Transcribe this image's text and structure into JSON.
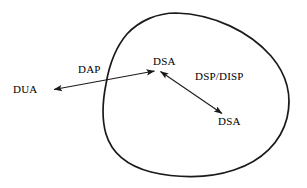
{
  "diagram": {
    "type": "x500-directory-architecture",
    "stroke_color": "#1a1a1a",
    "background_color": "#ffffff",
    "boundary": {
      "name": "directory-boundary-blob",
      "description": "closed freeform curve enclosing the directory"
    },
    "nodes": [
      {
        "id": "dua",
        "label": "DUA",
        "x": 13,
        "y": 83,
        "inside_boundary": false
      },
      {
        "id": "dsa-top",
        "label": "DSA",
        "x": 153,
        "y": 55,
        "inside_boundary": true
      },
      {
        "id": "dsa-bot",
        "label": "DSA",
        "x": 218,
        "y": 115,
        "inside_boundary": true
      }
    ],
    "edges": [
      {
        "id": "dap-edge",
        "label": "DAP",
        "label_x": 78,
        "label_y": 63,
        "from": "dua",
        "to": "dsa-top",
        "arrowheads": "both",
        "crosses_boundary": true
      },
      {
        "id": "dsp-disp-edge",
        "label": "DSP/DISP",
        "label_x": 195,
        "label_y": 70,
        "from": "dsa-top",
        "to": "dsa-bot",
        "arrowheads": "both",
        "crosses_boundary": false
      }
    ]
  },
  "labels": {
    "dua": "DUA",
    "dap": "DAP",
    "dsa_top": "DSA",
    "dsp_disp": "DSP/DISP",
    "dsa_bottom": "DSA"
  }
}
